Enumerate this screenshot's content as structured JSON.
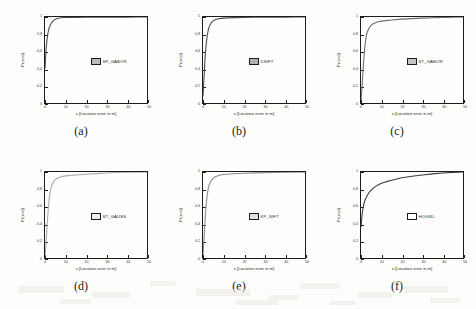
{
  "figure": {
    "axis_labels": {
      "x": "x [Location error in m]",
      "y": "Pr(x<d)"
    },
    "xticks": [
      "0",
      "10",
      "20",
      "30",
      "40",
      "50"
    ],
    "yticks": [
      "0",
      "0.2",
      "0.4",
      "0.6",
      "0.8",
      "1"
    ],
    "captions": [
      "(a)",
      "(b)",
      "(c)",
      "(d)",
      "(e)",
      "(f)"
    ]
  },
  "chart_data": [
    {
      "type": "line",
      "title": "",
      "panel": "(a)",
      "legend": "SF_GABOR",
      "legend_position": "center-right",
      "swatch_color": "#b9b9b9",
      "line_color": "#4a4a4a",
      "xlabel": "x [Location error in m]",
      "ylabel": "Pr(x<d)",
      "xlim": [
        0,
        50
      ],
      "ylim": [
        0,
        1
      ],
      "grid": false,
      "x": [
        0,
        0.5,
        1,
        1.5,
        2,
        2.5,
        3,
        4,
        5,
        6,
        7,
        8,
        10,
        15,
        20,
        25,
        30,
        35,
        40,
        45,
        50
      ],
      "y": [
        0.4,
        0.62,
        0.74,
        0.82,
        0.87,
        0.9,
        0.925,
        0.955,
        0.972,
        0.982,
        0.988,
        0.991,
        0.994,
        0.996,
        0.997,
        0.998,
        0.998,
        0.999,
        0.999,
        1.0,
        1.0
      ]
    },
    {
      "type": "line",
      "title": "",
      "panel": "(b)",
      "legend": "DSIFT",
      "legend_position": "center-right",
      "swatch_color": "#b0b0b0",
      "line_color": "#4a4a4a",
      "xlabel": "x [Location error in m]",
      "ylabel": "Pr(x<d)",
      "xlim": [
        0,
        50
      ],
      "ylim": [
        0,
        1
      ],
      "grid": false,
      "x": [
        0,
        0.5,
        1,
        1.5,
        2,
        2.5,
        3,
        4,
        5,
        6,
        7,
        8,
        10,
        15,
        20,
        25,
        30,
        35,
        40,
        45,
        50
      ],
      "y": [
        0.08,
        0.3,
        0.52,
        0.67,
        0.77,
        0.84,
        0.885,
        0.932,
        0.955,
        0.968,
        0.976,
        0.981,
        0.987,
        0.993,
        0.996,
        0.997,
        0.998,
        0.999,
        0.999,
        1.0,
        1.0
      ]
    },
    {
      "type": "line",
      "title": "",
      "panel": "(c)",
      "legend": "ST_GABOR",
      "legend_position": "center-right",
      "swatch_color": "#c4c4c4",
      "line_color": "#6a6a6a",
      "xlabel": "x [Location error in m]",
      "ylabel": "Pr(x<d)",
      "xlim": [
        0,
        50
      ],
      "ylim": [
        0,
        1
      ],
      "grid": false,
      "x": [
        0,
        0.5,
        1,
        1.5,
        2,
        2.5,
        3,
        4,
        5,
        6,
        8,
        10,
        15,
        20,
        25,
        30,
        35,
        40,
        45,
        50
      ],
      "y": [
        0.03,
        0.18,
        0.38,
        0.55,
        0.68,
        0.765,
        0.82,
        0.875,
        0.905,
        0.922,
        0.942,
        0.952,
        0.966,
        0.975,
        0.981,
        0.987,
        0.992,
        0.996,
        0.999,
        1.0
      ]
    },
    {
      "type": "line",
      "title": "",
      "panel": "(d)",
      "legend": "ST_GAUSS",
      "legend_position": "center-right",
      "swatch_color": "#ededed",
      "line_color": "#a8a8a8",
      "xlabel": "x [Location error in m]",
      "ylabel": "Pr(x<d)",
      "xlim": [
        0,
        50
      ],
      "ylim": [
        0,
        1
      ],
      "grid": false,
      "x": [
        0,
        0.5,
        1,
        1.5,
        2,
        2.5,
        3,
        4,
        5,
        6,
        8,
        10,
        15,
        20,
        25,
        30,
        35,
        40,
        45,
        50
      ],
      "y": [
        0.02,
        0.16,
        0.36,
        0.54,
        0.67,
        0.76,
        0.82,
        0.88,
        0.91,
        0.928,
        0.946,
        0.955,
        0.966,
        0.974,
        0.981,
        0.989,
        0.994,
        0.997,
        0.999,
        1.0
      ]
    },
    {
      "type": "line",
      "title": "",
      "panel": "(e)",
      "legend": "KP_SIFT",
      "legend_position": "center-right",
      "swatch_color": "#e0e0e0",
      "line_color": "#8a8a8a",
      "xlabel": "x [Location error in m]",
      "ylabel": "Pr(x<d)",
      "xlim": [
        0,
        50
      ],
      "ylim": [
        0,
        1
      ],
      "grid": false,
      "x": [
        0,
        0.5,
        1,
        1.5,
        2,
        2.5,
        3,
        4,
        5,
        6,
        8,
        10,
        15,
        20,
        25,
        30,
        35,
        40,
        45,
        50
      ],
      "y": [
        0.03,
        0.22,
        0.44,
        0.61,
        0.72,
        0.8,
        0.85,
        0.9,
        0.928,
        0.944,
        0.962,
        0.97,
        0.98,
        0.986,
        0.99,
        0.993,
        0.996,
        0.998,
        0.999,
        1.0
      ]
    },
    {
      "type": "line",
      "title": "",
      "panel": "(f)",
      "legend": "HOG3D",
      "legend_position": "center-right",
      "swatch_color": "#ffffff",
      "line_color": "#3a3a3a",
      "xlabel": "x [Location error in m]",
      "ylabel": "Pr(x<d)",
      "xlim": [
        0,
        50
      ],
      "ylim": [
        0,
        1
      ],
      "grid": false,
      "x": [
        0,
        0.5,
        1,
        1.5,
        2,
        3,
        4,
        5,
        6,
        8,
        10,
        12,
        15,
        20,
        25,
        30,
        35,
        40,
        45,
        50
      ],
      "y": [
        0.36,
        0.5,
        0.58,
        0.635,
        0.675,
        0.725,
        0.762,
        0.79,
        0.812,
        0.845,
        0.868,
        0.885,
        0.905,
        0.932,
        0.951,
        0.966,
        0.978,
        0.988,
        0.996,
        1.0
      ]
    }
  ]
}
